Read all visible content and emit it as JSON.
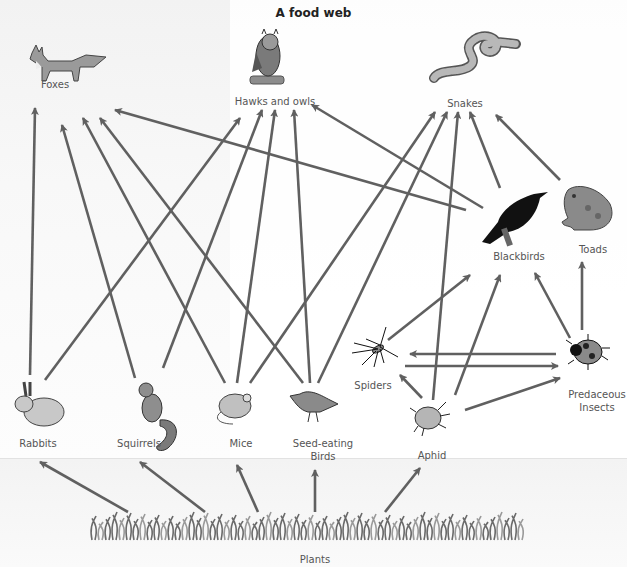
{
  "title": "A food web",
  "arrow_color": "#606060",
  "organisms": [
    {
      "id": "foxes",
      "label": "Foxes",
      "icon": "fox-icon",
      "level": "top-predator"
    },
    {
      "id": "hawks",
      "label": "Hawks and owls",
      "icon": "owl-icon",
      "level": "top-predator"
    },
    {
      "id": "snakes",
      "label": "Snakes",
      "icon": "snake-icon",
      "level": "top-predator"
    },
    {
      "id": "blackbirds",
      "label": "Blackbirds",
      "icon": "blackbird-icon",
      "level": "secondary-consumer"
    },
    {
      "id": "toads",
      "label": "Toads",
      "icon": "toad-icon",
      "level": "secondary-consumer"
    },
    {
      "id": "spiders",
      "label": "Spiders",
      "icon": "spider-icon",
      "level": "secondary-consumer"
    },
    {
      "id": "predaceous",
      "label": "Predaceous\nInsects",
      "icon": "ladybug-icon",
      "level": "secondary-consumer"
    },
    {
      "id": "rabbits",
      "label": "Rabbits",
      "icon": "rabbit-icon",
      "level": "herbivore"
    },
    {
      "id": "squirrels",
      "label": "Squirrels",
      "icon": "squirrel-icon",
      "level": "herbivore"
    },
    {
      "id": "mice",
      "label": "Mice",
      "icon": "mouse-icon",
      "level": "herbivore"
    },
    {
      "id": "seedbirds",
      "label": "Seed-eating\nBirds",
      "icon": "songbird-icon",
      "level": "herbivore"
    },
    {
      "id": "aphid",
      "label": "Aphid",
      "icon": "aphid-icon",
      "level": "herbivore"
    },
    {
      "id": "plants",
      "label": "Plants",
      "icon": "grass-icon",
      "level": "producer"
    }
  ],
  "edges": [
    {
      "from": "rabbits",
      "to": "foxes"
    },
    {
      "from": "rabbits",
      "to": "hawks"
    },
    {
      "from": "squirrels",
      "to": "foxes"
    },
    {
      "from": "squirrels",
      "to": "hawks"
    },
    {
      "from": "mice",
      "to": "foxes"
    },
    {
      "from": "mice",
      "to": "hawks"
    },
    {
      "from": "mice",
      "to": "snakes"
    },
    {
      "from": "seedbirds",
      "to": "foxes"
    },
    {
      "from": "seedbirds",
      "to": "hawks"
    },
    {
      "from": "seedbirds",
      "to": "snakes"
    },
    {
      "from": "blackbirds",
      "to": "foxes"
    },
    {
      "from": "blackbirds",
      "to": "hawks"
    },
    {
      "from": "blackbirds",
      "to": "snakes"
    },
    {
      "from": "toads",
      "to": "snakes"
    },
    {
      "from": "aphid",
      "to": "snakes"
    },
    {
      "from": "aphid",
      "to": "blackbirds"
    },
    {
      "from": "aphid",
      "to": "spiders"
    },
    {
      "from": "aphid",
      "to": "predaceous"
    },
    {
      "from": "spiders",
      "to": "blackbirds"
    },
    {
      "from": "spiders",
      "to": "predaceous"
    },
    {
      "from": "predaceous",
      "to": "spiders"
    },
    {
      "from": "predaceous",
      "to": "blackbirds"
    },
    {
      "from": "predaceous",
      "to": "toads"
    },
    {
      "from": "plants",
      "to": "rabbits"
    },
    {
      "from": "plants",
      "to": "squirrels"
    },
    {
      "from": "plants",
      "to": "mice"
    },
    {
      "from": "plants",
      "to": "seedbirds"
    },
    {
      "from": "plants",
      "to": "aphid"
    }
  ]
}
